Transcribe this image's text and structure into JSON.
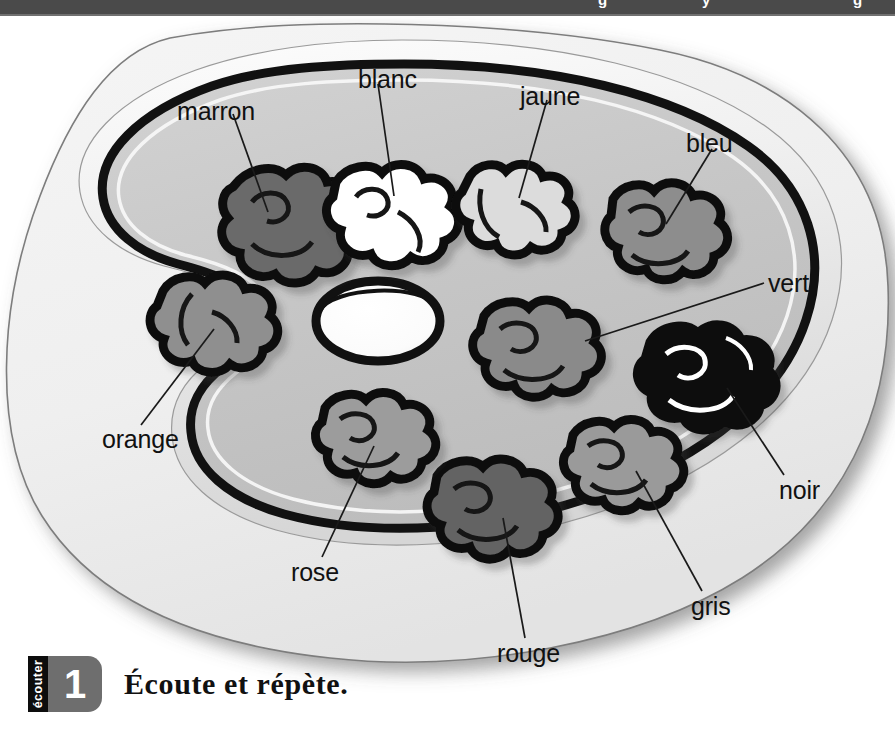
{
  "topbar": {
    "clipped_text_marks": [
      "g",
      "y",
      "g"
    ]
  },
  "illustration": {
    "title": "painter-palette-with-paint-blobs",
    "palette_fill": "#c9c9c9",
    "palette_outline": "#000000",
    "card_fill": "#f0f0f0",
    "labels": [
      {
        "id": "marron",
        "text": "marron",
        "x": 177,
        "y": 87,
        "blob_hex": "#6a6a6a"
      },
      {
        "id": "blanc",
        "text": "blanc",
        "x": 362,
        "y": 55,
        "blob_hex": "#ffffff"
      },
      {
        "id": "jaune",
        "text": "jaune",
        "x": 521,
        "y": 72,
        "blob_hex": "#d8d8d8"
      },
      {
        "id": "bleu",
        "text": "bleu",
        "x": 687,
        "y": 120,
        "blob_hex": "#8d8d8d"
      },
      {
        "id": "vert",
        "text": "vert",
        "x": 769,
        "y": 265,
        "blob_hex": "#8a8a8a"
      },
      {
        "id": "noir",
        "text": "noir",
        "x": 780,
        "y": 472,
        "blob_hex": "#0a0a0a"
      },
      {
        "id": "gris",
        "text": "gris",
        "x": 690,
        "y": 589,
        "blob_hex": "#9a9a9a"
      },
      {
        "id": "rouge",
        "text": "rouge",
        "x": 500,
        "y": 636,
        "blob_hex": "#636363"
      },
      {
        "id": "rose",
        "text": "rose",
        "x": 293,
        "y": 554,
        "blob_hex": "#9c9c9c"
      },
      {
        "id": "orange",
        "text": "orange",
        "x": 109,
        "y": 421,
        "blob_hex": "#8f8f8f"
      }
    ],
    "thumb_hole": "ellipse"
  },
  "exercise": {
    "tab_label": "écouter",
    "number": "1",
    "instruction": "Écoute et répète."
  }
}
